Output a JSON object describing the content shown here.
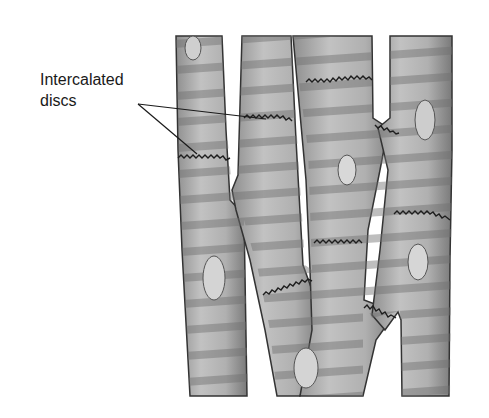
{
  "figure": {
    "label": {
      "line1": "Intercalated",
      "line2": "discs",
      "pointer_targets": 2
    },
    "colors": {
      "background": "#ffffff",
      "fiber_fill": "#a9a9a9",
      "fiber_light": "#c4c4c4",
      "striation": "#7e7e7e",
      "outline": "#333333",
      "nucleus": "#d4d4d4",
      "disc_line": "#222222",
      "label_text": "#1a1a1a"
    },
    "fibers": [
      {
        "name": "fiber-left"
      },
      {
        "name": "fiber-center-left"
      },
      {
        "name": "fiber-center"
      },
      {
        "name": "fiber-right"
      }
    ],
    "nuclei_count": 5,
    "intercalated_discs_count": 9
  }
}
